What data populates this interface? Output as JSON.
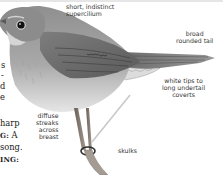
{
  "annotations": {
    "supercilium": "short, indistinct\nsupercilium",
    "tail": "broad\nrounded tail",
    "undertail": "white tips to\nlong undertail\ncoverts",
    "breast": "diffuse\nstreaks\nacross\nbreast",
    "behaviour": "skulks"
  },
  "body_text_fragments": {
    "line1": "s",
    "line2": "-",
    "line3": "d",
    "line4": "e",
    "line5": "harp",
    "line6_bold": "G:",
    "line6_rest": " A",
    "line7": "song.",
    "line8_bold": "ING:"
  },
  "colors": {
    "plumage_light": "#b8b8b8",
    "plumage_mid": "#8a8a8a",
    "plumage_dark": "#4a4a4a",
    "text": "#333333"
  }
}
